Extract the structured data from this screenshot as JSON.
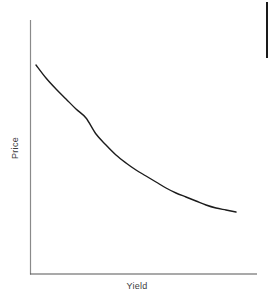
{
  "figure": {
    "background_color": "#ffffff",
    "width": 274,
    "height": 304
  },
  "labels": {
    "y_axis": "Price",
    "x_axis": "Yield"
  },
  "style": {
    "curve_color": "#1c1c1c",
    "curve_width": 1.4,
    "y_axis_color": "#8a8a8a",
    "x_axis_color": "#555555",
    "axis_width": 1.2,
    "text_color": "#3d3d3d",
    "edge_bar_color": "#1a1a1a"
  },
  "axes": {
    "origin_x": 30,
    "origin_y": 274,
    "y_top": 20,
    "x_right": 257
  },
  "edge_bar": {
    "x": 266,
    "y": 2,
    "width": 2,
    "height": 56
  },
  "chart_data": {
    "type": "line",
    "title": "",
    "subtitle": "",
    "xlabel": "Yield",
    "ylabel": "Price",
    "grid": false,
    "legend": false,
    "annotations": [],
    "xticks": [],
    "yticks": [],
    "xlim": [
      0,
      100
    ],
    "ylim": [
      0,
      100
    ],
    "series": [
      {
        "name": "Price vs Yield",
        "color": "#1c1c1c",
        "x": [
          0,
          5,
          10,
          15,
          20,
          25,
          30,
          35,
          40,
          45,
          50,
          55,
          60,
          65,
          70,
          75,
          80,
          85,
          90,
          95,
          100
        ],
        "y": [
          100,
          90.5,
          81.8,
          73.9,
          66.8,
          60.4,
          54.6,
          49.4,
          44.8,
          40.7,
          37.1,
          33.9,
          31.1,
          28.7,
          26.6,
          24.8,
          23.3,
          22.0,
          21.0,
          20.2,
          19.6
        ],
        "pixel_points": [
          [
            36,
            65
          ],
          [
            46,
            78
          ],
          [
            56,
            89
          ],
          [
            66,
            99
          ],
          [
            76,
            109
          ],
          [
            86,
            118
          ],
          [
            96,
            134
          ],
          [
            106,
            145
          ],
          [
            116,
            155
          ],
          [
            126,
            163
          ],
          [
            136,
            170
          ],
          [
            146,
            176
          ],
          [
            156,
            182
          ],
          [
            166,
            188
          ],
          [
            176,
            193
          ],
          [
            186,
            197
          ],
          [
            196,
            201
          ],
          [
            206,
            205
          ],
          [
            216,
            208
          ],
          [
            226,
            210
          ],
          [
            236,
            212
          ]
        ]
      }
    ]
  }
}
